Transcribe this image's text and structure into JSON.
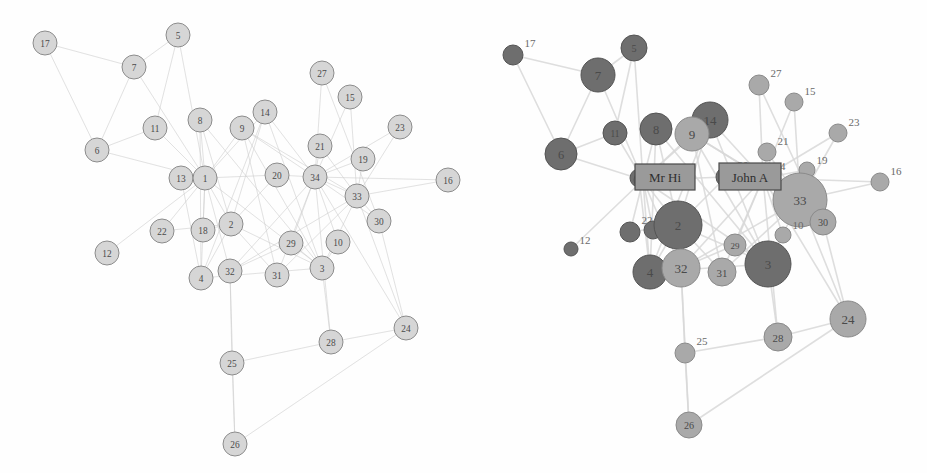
{
  "figure": {
    "title": "",
    "panels": [
      {
        "name": "uniform-layout",
        "style": "uniform node size, single colour"
      },
      {
        "name": "degree-weighted-layout",
        "style": "node size by degree, colour by faction, leader labels"
      }
    ]
  },
  "colors": {
    "background": "#ffffff",
    "node_plain_fill": "#d6d6d6",
    "node_plain_stroke": "#8c8c8c",
    "faction_mr_hi_fill": "#6e6e6e",
    "faction_mr_hi_stroke": "#545454",
    "faction_john_a_fill": "#a9a9a9",
    "faction_john_a_stroke": "#8a8a8a",
    "edge": "#cfcfcf",
    "edge_right": "#d9d9d9",
    "label_text": "#4a4a4a",
    "box_fill": "#9a9a9a",
    "box_stroke": "#4a4a4a"
  },
  "labels": {
    "mr_hi": "Mr Hi",
    "john_a": "John A"
  },
  "chart_data": {
    "type": "scatter",
    "xlabel": "",
    "ylabel": "",
    "grid": false,
    "legend": "none",
    "node_ids": [
      1,
      2,
      3,
      4,
      5,
      6,
      7,
      8,
      9,
      10,
      11,
      12,
      13,
      14,
      15,
      16,
      17,
      18,
      19,
      20,
      21,
      22,
      23,
      24,
      25,
      26,
      27,
      28,
      29,
      30,
      31,
      32,
      33,
      34
    ],
    "factions": {
      "mr_hi": [
        1,
        2,
        3,
        4,
        5,
        6,
        7,
        8,
        11,
        12,
        13,
        14,
        17,
        18,
        20,
        22
      ],
      "john_a": [
        9,
        10,
        15,
        16,
        19,
        21,
        23,
        24,
        25,
        26,
        27,
        28,
        29,
        30,
        31,
        32,
        33,
        34
      ]
    },
    "degrees": {
      "1": 16,
      "2": 9,
      "3": 10,
      "4": 6,
      "5": 3,
      "6": 4,
      "7": 4,
      "8": 4,
      "9": 5,
      "10": 2,
      "11": 3,
      "12": 1,
      "13": 2,
      "14": 5,
      "15": 2,
      "16": 2,
      "17": 2,
      "18": 2,
      "19": 2,
      "20": 3,
      "21": 2,
      "22": 2,
      "23": 2,
      "24": 5,
      "25": 3,
      "26": 3,
      "27": 2,
      "28": 4,
      "29": 3,
      "30": 4,
      "31": 4,
      "32": 6,
      "33": 12,
      "34": 17
    },
    "nodes_left": [
      {
        "id": 17,
        "x": 45,
        "y": 43,
        "r": 12
      },
      {
        "id": 5,
        "x": 178,
        "y": 35,
        "r": 12
      },
      {
        "id": 7,
        "x": 134,
        "y": 67,
        "r": 12
      },
      {
        "id": 27,
        "x": 322,
        "y": 73,
        "r": 12
      },
      {
        "id": 15,
        "x": 350,
        "y": 97,
        "r": 12
      },
      {
        "id": 14,
        "x": 265,
        "y": 112,
        "r": 12
      },
      {
        "id": 11,
        "x": 155,
        "y": 128,
        "r": 12
      },
      {
        "id": 8,
        "x": 200,
        "y": 120,
        "r": 12
      },
      {
        "id": 9,
        "x": 242,
        "y": 128,
        "r": 12
      },
      {
        "id": 23,
        "x": 400,
        "y": 127,
        "r": 12
      },
      {
        "id": 21,
        "x": 320,
        "y": 146,
        "r": 12
      },
      {
        "id": 6,
        "x": 97,
        "y": 150,
        "r": 12
      },
      {
        "id": 19,
        "x": 363,
        "y": 159,
        "r": 12
      },
      {
        "id": 13,
        "x": 181,
        "y": 178,
        "r": 12
      },
      {
        "id": 1,
        "x": 205,
        "y": 178,
        "r": 12
      },
      {
        "id": 20,
        "x": 277,
        "y": 175,
        "r": 12
      },
      {
        "id": 34,
        "x": 315,
        "y": 177,
        "r": 12
      },
      {
        "id": 16,
        "x": 448,
        "y": 180,
        "r": 12
      },
      {
        "id": 33,
        "x": 357,
        "y": 196,
        "r": 12
      },
      {
        "id": 30,
        "x": 379,
        "y": 221,
        "r": 12
      },
      {
        "id": 22,
        "x": 162,
        "y": 231,
        "r": 12
      },
      {
        "id": 18,
        "x": 203,
        "y": 230,
        "r": 12
      },
      {
        "id": 2,
        "x": 231,
        "y": 224,
        "r": 12
      },
      {
        "id": 29,
        "x": 291,
        "y": 243,
        "r": 12
      },
      {
        "id": 10,
        "x": 338,
        "y": 242,
        "r": 12
      },
      {
        "id": 12,
        "x": 107,
        "y": 253,
        "r": 12
      },
      {
        "id": 4,
        "x": 201,
        "y": 278,
        "r": 12
      },
      {
        "id": 32,
        "x": 230,
        "y": 271,
        "r": 12
      },
      {
        "id": 31,
        "x": 277,
        "y": 275,
        "r": 12
      },
      {
        "id": 3,
        "x": 322,
        "y": 268,
        "r": 12
      },
      {
        "id": 28,
        "x": 331,
        "y": 342,
        "r": 12
      },
      {
        "id": 24,
        "x": 406,
        "y": 328,
        "r": 12
      },
      {
        "id": 25,
        "x": 232,
        "y": 363,
        "r": 12
      },
      {
        "id": 26,
        "x": 235,
        "y": 444,
        "r": 12
      }
    ],
    "nodes_right": [
      {
        "id": 17,
        "x": 50,
        "y": 55,
        "r": 10
      },
      {
        "id": 5,
        "x": 171,
        "y": 48,
        "r": 13
      },
      {
        "id": 7,
        "x": 135,
        "y": 75,
        "r": 17
      },
      {
        "id": 27,
        "x": 296,
        "y": 85,
        "r": 10
      },
      {
        "id": 15,
        "x": 331,
        "y": 102,
        "r": 9
      },
      {
        "id": 14,
        "x": 247,
        "y": 120,
        "r": 18
      },
      {
        "id": 11,
        "x": 152,
        "y": 133,
        "r": 12
      },
      {
        "id": 8,
        "x": 193,
        "y": 129,
        "r": 16
      },
      {
        "id": 9,
        "x": 229,
        "y": 134,
        "r": 17
      },
      {
        "id": 23,
        "x": 375,
        "y": 133,
        "r": 9
      },
      {
        "id": 21,
        "x": 304,
        "y": 152,
        "r": 9
      },
      {
        "id": 6,
        "x": 98,
        "y": 154,
        "r": 16
      },
      {
        "id": 19,
        "x": 344,
        "y": 170,
        "r": 8
      },
      {
        "id": 13,
        "x": 176,
        "y": 178,
        "r": 9
      },
      {
        "id": 1,
        "x": 180,
        "y": 180,
        "r": 9
      },
      {
        "id": 20,
        "x": 263,
        "y": 177,
        "r": 10
      },
      {
        "id": 34,
        "x": 300,
        "y": 178,
        "r": 10
      },
      {
        "id": 16,
        "x": 417,
        "y": 182,
        "r": 9
      },
      {
        "id": 33,
        "x": 337,
        "y": 200,
        "r": 27
      },
      {
        "id": 30,
        "x": 360,
        "y": 222,
        "r": 13
      },
      {
        "id": 22,
        "x": 167,
        "y": 232,
        "r": 10
      },
      {
        "id": 18,
        "x": 190,
        "y": 230,
        "r": 9
      },
      {
        "id": 2,
        "x": 215,
        "y": 225,
        "r": 24
      },
      {
        "id": 29,
        "x": 272,
        "y": 245,
        "r": 11
      },
      {
        "id": 10,
        "x": 320,
        "y": 235,
        "r": 8
      },
      {
        "id": 12,
        "x": 108,
        "y": 249,
        "r": 7
      },
      {
        "id": 4,
        "x": 187,
        "y": 272,
        "r": 17
      },
      {
        "id": 32,
        "x": 218,
        "y": 268,
        "r": 19
      },
      {
        "id": 31,
        "x": 259,
        "y": 272,
        "r": 14
      },
      {
        "id": 3,
        "x": 305,
        "y": 264,
        "r": 23
      },
      {
        "id": 28,
        "x": 315,
        "y": 337,
        "r": 14
      },
      {
        "id": 24,
        "x": 385,
        "y": 319,
        "r": 18
      },
      {
        "id": 25,
        "x": 222,
        "y": 353,
        "r": 10
      },
      {
        "id": 26,
        "x": 226,
        "y": 425,
        "r": 13
      }
    ],
    "edges": [
      [
        1,
        2
      ],
      [
        1,
        3
      ],
      [
        1,
        4
      ],
      [
        1,
        5
      ],
      [
        1,
        6
      ],
      [
        1,
        7
      ],
      [
        1,
        8
      ],
      [
        1,
        9
      ],
      [
        1,
        11
      ],
      [
        1,
        12
      ],
      [
        1,
        13
      ],
      [
        1,
        14
      ],
      [
        1,
        18
      ],
      [
        1,
        20
      ],
      [
        1,
        22
      ],
      [
        1,
        32
      ],
      [
        2,
        3
      ],
      [
        2,
        4
      ],
      [
        2,
        8
      ],
      [
        2,
        14
      ],
      [
        2,
        18
      ],
      [
        2,
        20
      ],
      [
        2,
        22
      ],
      [
        2,
        31
      ],
      [
        3,
        4
      ],
      [
        3,
        8
      ],
      [
        3,
        9
      ],
      [
        3,
        10
      ],
      [
        3,
        14
      ],
      [
        3,
        28
      ],
      [
        3,
        29
      ],
      [
        3,
        33
      ],
      [
        4,
        8
      ],
      [
        4,
        13
      ],
      [
        4,
        14
      ],
      [
        5,
        7
      ],
      [
        5,
        11
      ],
      [
        6,
        7
      ],
      [
        6,
        11
      ],
      [
        6,
        17
      ],
      [
        7,
        17
      ],
      [
        9,
        31
      ],
      [
        9,
        33
      ],
      [
        9,
        34
      ],
      [
        10,
        34
      ],
      [
        14,
        34
      ],
      [
        15,
        33
      ],
      [
        15,
        34
      ],
      [
        16,
        33
      ],
      [
        16,
        34
      ],
      [
        19,
        33
      ],
      [
        19,
        34
      ],
      [
        20,
        34
      ],
      [
        21,
        33
      ],
      [
        21,
        34
      ],
      [
        23,
        33
      ],
      [
        23,
        34
      ],
      [
        24,
        26
      ],
      [
        24,
        28
      ],
      [
        24,
        30
      ],
      [
        24,
        33
      ],
      [
        24,
        34
      ],
      [
        25,
        26
      ],
      [
        25,
        28
      ],
      [
        25,
        32
      ],
      [
        26,
        32
      ],
      [
        27,
        30
      ],
      [
        27,
        34
      ],
      [
        28,
        34
      ],
      [
        29,
        32
      ],
      [
        29,
        34
      ],
      [
        30,
        33
      ],
      [
        30,
        34
      ],
      [
        31,
        33
      ],
      [
        31,
        34
      ],
      [
        32,
        33
      ],
      [
        32,
        34
      ],
      [
        33,
        34
      ]
    ]
  }
}
